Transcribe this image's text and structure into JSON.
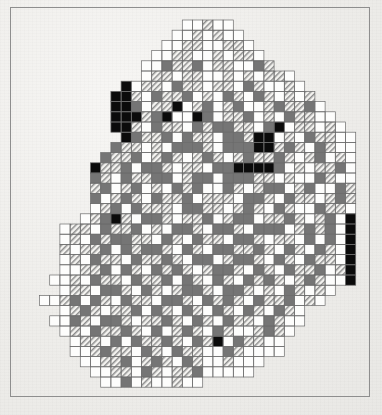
{
  "figure": {
    "title": "Raster grid distribution map",
    "frame": {
      "x": 10,
      "y": 7,
      "width": 360,
      "height": 390,
      "stroke": "#8e8e8e",
      "stroke_width": 1
    },
    "background_color": "#efeeeb"
  },
  "grid": {
    "origin_x": 39.5,
    "origin_y": 20.0,
    "cell_size": 10.2,
    "columns": 31,
    "rows": 36,
    "line_color": "#6b6b6b",
    "line_width": 0.7
  },
  "classes": [
    {
      "key": "0",
      "name": "empty",
      "label": "no data / outside",
      "fill": "none",
      "hatch": false
    },
    {
      "key": "1",
      "name": "white",
      "label": "class 1 (lowest)",
      "fill": "#fdfdfc",
      "hatch": false
    },
    {
      "key": "2",
      "name": "hatch",
      "label": "class 2",
      "fill": "#f2f1ee",
      "hatch": true
    },
    {
      "key": "3",
      "name": "gray",
      "label": "class 3",
      "fill": "#757575",
      "hatch": false
    },
    {
      "key": "4",
      "name": "black",
      "label": "class 4 (highest)",
      "fill": "#0b0b0b",
      "hatch": false
    }
  ],
  "chart_data": {
    "type": "heatmap",
    "title": "Raster grid distribution map",
    "xlabel": "",
    "ylabel": "",
    "legend": "none",
    "grid": true,
    "categories": [
      "empty",
      "white",
      "hatch",
      "gray",
      "black"
    ],
    "value_codes": {
      "empty": 0,
      "white": 1,
      "hatch": 2,
      "gray": 3,
      "black": 4
    },
    "ncols": 31,
    "nrows": 36,
    "rows": [
      "0000000000000011211000000000000",
      "0000000000000112121100000000000",
      "0000000000001122112210000000000",
      "0000000000011221121221000000000",
      "0000000000113223122113200000000",
      "0000000000122122112121221000000",
      "0000000041221322122132112100000",
      "0000000442132231213213212120000",
      "0000000443122412312311232231000",
      "0000000444234114312231213221100",
      "0000000442132213233221341221210",
      "0000000043223132213324412132211",
      "0000000322121333213334423213211",
      "0000003223123212321232232123121",
      "0000042231332122133444431212231",
      "0000032132233123313332212113211",
      "0000023123121323113212331231132",
      "0000031232132231222133213221232",
      "0000012313222133221232132113221",
      "0000123421332122312331223212314",
      "0012213223121332133213331232314",
      "0012132332213213221332122131314",
      "0021223132332132133223213213214",
      "0012132213223213312332132132214",
      "0011223132132321233213213223124",
      "0112132213223132132132321232114",
      "0012213321321233213321213212100",
      "1123132132213321323213223121000",
      "0012321223132132132132132100000",
      "0113213321223213213221321100000",
      "0012132232131232132112321000000",
      "0001221313223213241322110000000",
      "0001123221321322113211110000000",
      "0000112231232132112111000000000",
      "0000011221321223111110000000000",
      "0000001131211211000000000000000"
    ]
  }
}
